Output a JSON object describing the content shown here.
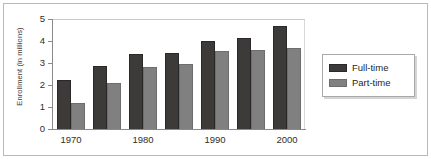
{
  "chart_data": {
    "type": "bar",
    "title": "",
    "xlabel": "",
    "ylabel": "Enrollment (in millions)",
    "ylim": [
      0,
      5
    ],
    "ytick_labels": [
      "5",
      "4",
      "3",
      "2",
      "1",
      "0"
    ],
    "yticks": [
      5,
      4,
      3,
      2,
      1,
      0
    ],
    "grid": false,
    "legend_position": "right",
    "categories": [
      "1970",
      "1975",
      "1980",
      "1985",
      "1990",
      "1995",
      "2000"
    ],
    "visible_tick_labels": [
      "1970",
      "1980",
      "1990",
      "2000"
    ],
    "series": [
      {
        "name": "Full-time",
        "color": "#3d3a3a",
        "values": [
          2.25,
          2.85,
          3.4,
          3.47,
          4.0,
          4.15,
          4.7
        ]
      },
      {
        "name": "Part-time",
        "color": "#808080",
        "values": [
          1.2,
          2.1,
          2.8,
          2.95,
          3.55,
          3.6,
          3.7
        ]
      }
    ]
  },
  "axis": {
    "y_title": "Enrollment (in millions)"
  },
  "legend": {
    "entries": [
      {
        "label": "Full-time"
      },
      {
        "label": "Part-time"
      }
    ]
  }
}
